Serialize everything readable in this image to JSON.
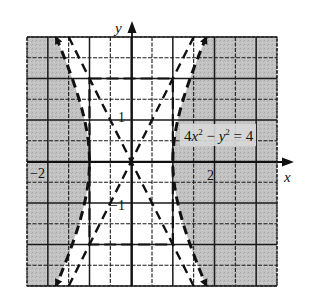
{
  "chart_data": {
    "type": "line",
    "title": "",
    "equation": "4x² − y² = 4",
    "inequality_shading": "4x² − y² ≥ 4 (shaded outside both branches)",
    "xlabel": "x",
    "ylabel": "y",
    "xlim": [
      -2.5,
      3.5
    ],
    "ylim": [
      -3,
      3
    ],
    "grid": true,
    "grid_step": 0.5,
    "tick_labels": [
      {
        "text": "−2",
        "x": -2,
        "axis": "x"
      },
      {
        "text": "2",
        "x": 2,
        "axis": "x"
      },
      {
        "text": "1",
        "y": 1,
        "axis": "y"
      },
      {
        "text": "−1",
        "y": -1,
        "axis": "y"
      }
    ],
    "series": [
      {
        "name": "hyperbola right branch",
        "style": "dashed",
        "function": "x = sqrt(1 + y^2/4)",
        "vertex": [
          1,
          0
        ]
      },
      {
        "name": "hyperbola left branch",
        "style": "dashed",
        "function": "x = -sqrt(1 + y^2/4)",
        "vertex": [
          -1,
          0
        ]
      },
      {
        "name": "asymptote",
        "style": "dashed",
        "function": "y = 2x"
      },
      {
        "name": "asymptote",
        "style": "dashed",
        "function": "y = -2x"
      },
      {
        "name": "fundamental rectangle",
        "style": "dashed",
        "corners": [
          [
            -1,
            2
          ],
          [
            1,
            2
          ],
          [
            1,
            -2
          ],
          [
            -1,
            -2
          ]
        ]
      }
    ]
  },
  "labels": {
    "x_axis": "x",
    "y_axis": "y",
    "equation": "4x² − y² = 4",
    "tick_neg2": "−2",
    "tick_pos2": "2",
    "tick_pos1": "1",
    "tick_neg1": "−1"
  },
  "colors": {
    "shade": "#bcbcbc",
    "line": "#111111",
    "grid": "#1a1a1a",
    "background": "#ffffff"
  }
}
